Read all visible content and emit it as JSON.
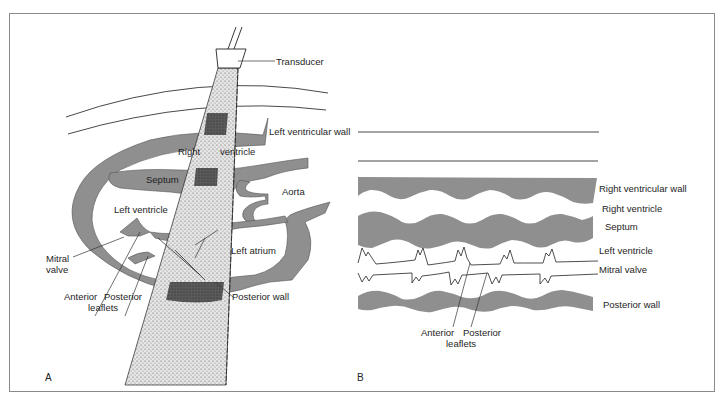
{
  "figure": {
    "panel_a": {
      "letter": "A",
      "labels": {
        "transducer": "Transducer",
        "left_ventricular_wall": "Left ventricular wall",
        "right": "Right",
        "ventricle": "ventricle",
        "septum": "Septum",
        "aorta": "Aorta",
        "left_ventricle": "Left ventricle",
        "left_atrium": "Left atrium",
        "mitral_valve_line1": "Mitral",
        "mitral_valve_line2": "valve",
        "anterior": "Anterior",
        "posterior": "Posterior",
        "leaflets": "leaflets",
        "posterior_wall": "Posterior wall"
      }
    },
    "panel_b": {
      "letter": "B",
      "labels": {
        "right_ventricular_wall": "Right ventricular wall",
        "right_ventricle": "Right ventricle",
        "septum": "Septum",
        "left_ventricle": "Left ventricle",
        "mitral_valve": "Mitral valve",
        "posterior_wall": "Posterior wall",
        "anterior": "Anterior",
        "posterior": "Posterior",
        "leaflets": "leaflets"
      }
    },
    "colors": {
      "tissue": "#8f8f8f",
      "tissue_dark": "#5e5e5e",
      "beam": "#d9d9d9",
      "line": "#2a2a2a",
      "frame": "#8a8a8a"
    }
  }
}
